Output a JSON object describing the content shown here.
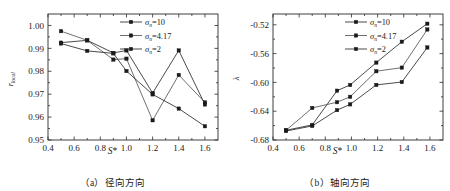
{
  "figure": {
    "panels": [
      {
        "id": "panel-a",
        "caption": "（a）径向方向",
        "xlabel": "S*",
        "ylabel": "r_local"
      },
      {
        "id": "panel-b",
        "caption": "（b）轴向方向",
        "xlabel": "S*",
        "ylabel": "λ"
      }
    ]
  },
  "chart_data": [
    {
      "type": "line",
      "title": "",
      "caption": "（a）径向方向",
      "xlabel": "S*",
      "ylabel": "r_local",
      "xlim": [
        0.4,
        1.7
      ],
      "ylim": [
        0.95,
        1.005
      ],
      "xticks": [
        0.4,
        0.6,
        0.8,
        1.0,
        1.2,
        1.4,
        1.6
      ],
      "xtick_labels": [
        "0.4",
        "0.6",
        "0.8",
        "1.0",
        "1.2",
        "1.4",
        "1.6"
      ],
      "yticks": [
        0.95,
        0.96,
        0.97,
        0.98,
        0.99,
        1.0
      ],
      "ytick_labels": [
        "0.95",
        "0.96",
        "0.97",
        "0.98",
        "0.99",
        "1.00"
      ],
      "grid": false,
      "legend_position": "top-right",
      "series": [
        {
          "name": "σ_n=10",
          "marker": "square",
          "color": "#2b2b2b",
          "x": [
            0.5,
            0.7,
            0.9,
            1.0,
            1.2,
            1.4,
            1.6
          ],
          "values": [
            0.9925,
            0.9935,
            0.988,
            0.9891,
            0.9705,
            0.9891,
            0.9655
          ]
        },
        {
          "name": "σ_n=4.17",
          "marker": "square",
          "color": "#555555",
          "x": [
            0.5,
            0.7,
            0.9,
            1.0,
            1.2,
            1.4,
            1.6
          ],
          "values": [
            0.9975,
            0.9935,
            0.9851,
            0.9855,
            0.9586,
            0.9784,
            0.9664
          ]
        },
        {
          "name": "σ_n=2",
          "marker": "square",
          "color": "#2b2b2b",
          "x": [
            0.5,
            0.7,
            0.9,
            1.0,
            1.2,
            1.4,
            1.6
          ],
          "values": [
            0.9921,
            0.9889,
            0.9878,
            0.9801,
            0.9699,
            0.9637,
            0.956
          ]
        }
      ]
    },
    {
      "type": "line",
      "title": "",
      "caption": "（b）轴向方向",
      "xlabel": "S*",
      "ylabel": "λ",
      "xlim": [
        0.4,
        1.7
      ],
      "ylim": [
        -0.68,
        -0.505
      ],
      "xticks": [
        0.4,
        0.6,
        0.8,
        1.0,
        1.2,
        1.4,
        1.6
      ],
      "xtick_labels": [
        "0.4",
        "0.6",
        "0.8",
        "1.0",
        "1.2",
        "1.4",
        "1.6"
      ],
      "yticks": [
        -0.68,
        -0.64,
        -0.6,
        -0.56,
        -0.52
      ],
      "ytick_labels": [
        "-0.68",
        "-0.64",
        "-0.60",
        "-0.56",
        "-0.52"
      ],
      "grid": false,
      "legend_position": "top-right",
      "series": [
        {
          "name": "σ_n=10",
          "marker": "square",
          "color": "#2b2b2b",
          "x": [
            0.5,
            0.7,
            0.89,
            0.99,
            1.19,
            1.385,
            1.58
          ],
          "values": [
            -0.6665,
            -0.659,
            -0.6115,
            -0.6035,
            -0.5725,
            -0.5435,
            -0.5185
          ]
        },
        {
          "name": "σ_n=4.17",
          "marker": "square",
          "color": "#555555",
          "x": [
            0.5,
            0.7,
            0.89,
            0.99,
            1.19,
            1.385,
            1.58
          ],
          "values": [
            -0.6665,
            -0.6355,
            -0.6275,
            -0.62,
            -0.5845,
            -0.5795,
            -0.5265
          ]
        },
        {
          "name": "σ_n=2",
          "marker": "square",
          "color": "#2b2b2b",
          "x": [
            0.5,
            0.7,
            0.89,
            0.99,
            1.19,
            1.385,
            1.58
          ],
          "values": [
            -0.6675,
            -0.6605,
            -0.6385,
            -0.6305,
            -0.6035,
            -0.5995,
            -0.5515
          ]
        }
      ]
    }
  ],
  "legend": {
    "entries": [
      {
        "symbol": "σ",
        "subscript": "n",
        "value": "=10",
        "full": "σn=10"
      },
      {
        "symbol": "σ",
        "subscript": "n",
        "value": "=4.17",
        "full": "σn=4.17"
      },
      {
        "symbol": "σ",
        "subscript": "n",
        "value": "=2",
        "full": "σn=2"
      }
    ]
  }
}
